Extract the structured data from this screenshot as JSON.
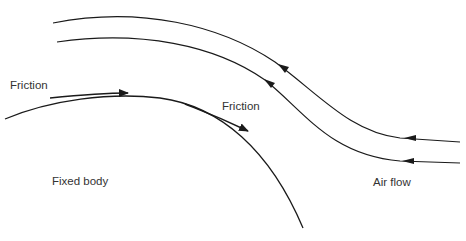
{
  "diagram": {
    "labels": {
      "friction_left": "Friction",
      "friction_right": "Friction",
      "fixed_body": "Fixed body",
      "air_flow": "Air flow"
    },
    "colors": {
      "line": "#1a1a1a",
      "text": "#333333",
      "background": "#ffffff"
    }
  }
}
